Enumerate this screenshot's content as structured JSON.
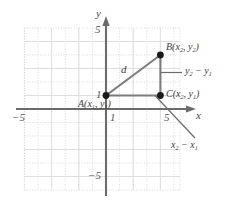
{
  "figure": {
    "colors": {
      "axis": "#6b6b6b",
      "grid": "#cfcfcf",
      "triangle": "#7a7a7a",
      "point": "#1a1a1a",
      "text": "#3d3d3d",
      "leader": "#6b6b6b",
      "background": "#ffffff"
    }
  },
  "axes": {
    "x_label": "x",
    "y_label": "y",
    "x_ticks": [
      {
        "value": -5,
        "label": "−5"
      },
      {
        "value": 1,
        "label": "1"
      },
      {
        "value": 5,
        "label": "5"
      }
    ],
    "y_ticks": [
      {
        "value": 5,
        "label": "5"
      },
      {
        "value": 1,
        "label": "1"
      },
      {
        "value": -5,
        "label": "−5"
      }
    ],
    "xlim": [
      -6,
      6
    ],
    "ylim": [
      -6,
      6
    ],
    "grid": true,
    "grid_step": 1
  },
  "points": [
    {
      "id": "A",
      "label": "A(x₁, y₁)",
      "label_parts": {
        "name": "A",
        "open": "(",
        "x": "x",
        "xsub": "1",
        "comma": ", ",
        "y": "y",
        "ysub": "1",
        "close": ")"
      },
      "coords": [
        1,
        1
      ]
    },
    {
      "id": "B",
      "label": "B(x₂, y₂)",
      "label_parts": {
        "name": "B",
        "open": "(",
        "x": "x",
        "xsub": "2",
        "comma": ", ",
        "y": "y",
        "ysub": "2",
        "close": ")"
      },
      "coords": [
        4,
        4
      ]
    },
    {
      "id": "C",
      "label": "C(x₂, y₁)",
      "label_parts": {
        "name": "C",
        "open": "(",
        "x": "x",
        "xsub": "2",
        "comma": ", ",
        "y": "y",
        "ysub": "1",
        "close": ")"
      },
      "coords": [
        4,
        1
      ]
    }
  ],
  "annotations": {
    "hypotenuse": {
      "label": "d",
      "from": "A",
      "to": "B"
    },
    "vertical_leg": {
      "label": "y₂ − y₁",
      "parts": {
        "y2": "y",
        "y2sub": "2",
        "minus": " − ",
        "y1": "y",
        "y1sub": "1"
      },
      "from": "C",
      "to": "B"
    },
    "horizontal_leg": {
      "label": "x₂ − x₁",
      "parts": {
        "x2": "x",
        "x2sub": "2",
        "minus": " − ",
        "x1": "x",
        "x1sub": "1"
      },
      "from": "A",
      "to": "C"
    }
  }
}
